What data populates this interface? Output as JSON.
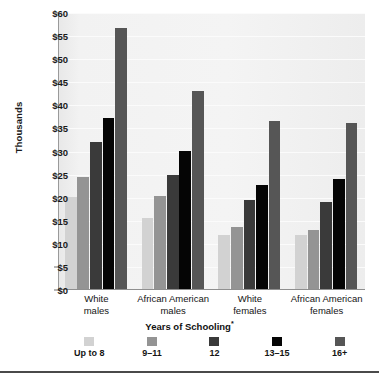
{
  "chart_data": {
    "type": "bar",
    "title": "",
    "xlabel": "Years of Schooling*",
    "ylabel": "Thousands",
    "categories": [
      "White\nmales",
      "African American\nmales",
      "White\nfemales",
      "African American\nfemales"
    ],
    "category_lines": [
      [
        "White",
        "males"
      ],
      [
        "African American",
        "males"
      ],
      [
        "White",
        "females"
      ],
      [
        "African American",
        "females"
      ]
    ],
    "series": [
      {
        "name": "Up to 8",
        "color": "#d2d2d2",
        "values": [
          20.2,
          15.7,
          12.0,
          12.0
        ]
      },
      {
        "name": "9–11",
        "color": "#949494",
        "values": [
          24.5,
          20.4,
          13.6,
          13.0
        ]
      },
      {
        "name": "12",
        "color": "#3a3a3a",
        "values": [
          32.0,
          25.0,
          19.4,
          19.0
        ]
      },
      {
        "name": "13–15",
        "color": "#050505",
        "values": [
          37.2,
          30.2,
          22.7,
          24.0
        ]
      },
      {
        "name": "16+",
        "color": "#565656",
        "values": [
          56.7,
          43.0,
          36.6,
          36.2
        ]
      }
    ],
    "ylim": [
      0,
      60
    ],
    "yticks": [
      0,
      5,
      10,
      15,
      20,
      25,
      30,
      35,
      40,
      45,
      50,
      55,
      60
    ],
    "ytick_labels": [
      "$0",
      "$5",
      "$10",
      "$15",
      "$20",
      "$25",
      "$30",
      "$35",
      "$40",
      "$45",
      "$50",
      "$55",
      "$60"
    ],
    "grid": true,
    "legend_position": "bottom",
    "footnote_marker": "*",
    "plot_background": "#f0f0f0"
  }
}
